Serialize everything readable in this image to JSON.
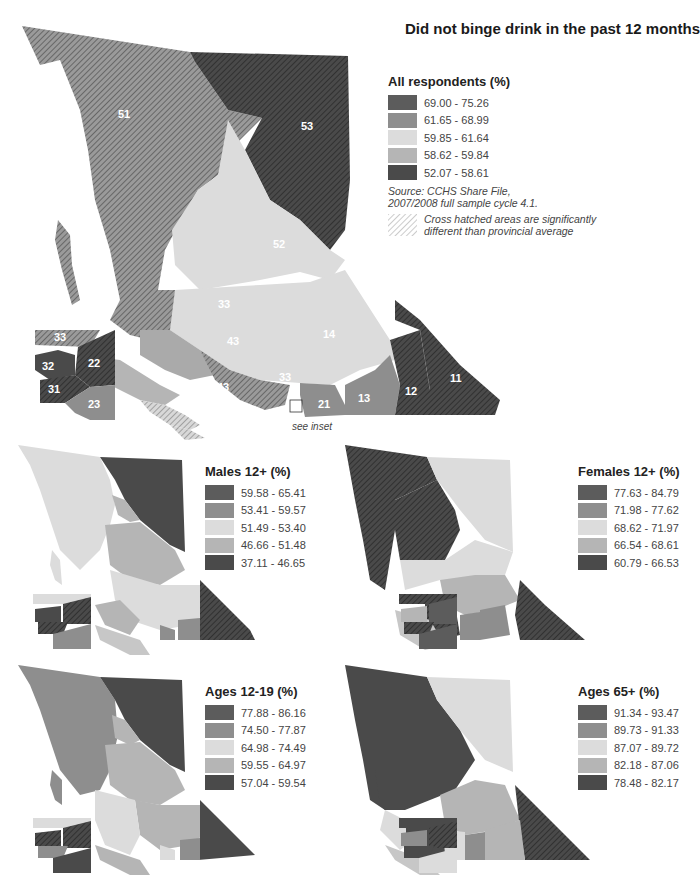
{
  "title": "Did not binge drink in the past 12 months",
  "colors": {
    "c1": "#5c5c5c",
    "c2": "#8e8e8e",
    "c3": "#dcdcdc",
    "c4": "#b5b5b5",
    "c5": "#4a4a4a"
  },
  "main_map": {
    "legend_title": "All respondents (%)",
    "classes": [
      "69.00 - 75.26",
      "61.65 - 68.99",
      "59.85 - 61.64",
      "58.62 - 59.84",
      "52.07 - 58.61"
    ],
    "source_line1": "Source: CCHS Share File,",
    "source_line2": "2007/2008 full sample cycle 4.1.",
    "hatch_note_line1": "Cross hatched areas are significantly",
    "hatch_note_line2": "different than provincial average",
    "region_labels": {
      "r51": "51",
      "r53": "53",
      "r52": "52",
      "r14": "14",
      "r33a": "33",
      "r43a": "43",
      "r43b": "43",
      "r33b": "33",
      "r42": "42",
      "r41": "41",
      "r21": "21",
      "r13": "13",
      "r12": "12",
      "r11": "11",
      "i33": "33",
      "i22": "22",
      "i32": "32",
      "i31": "31",
      "i23": "23"
    },
    "see_inset": "see inset"
  },
  "small_maps": [
    {
      "legend_title": "Males 12+ (%)",
      "classes": [
        "59.58 - 65.41",
        "53.41 - 59.57",
        "51.49 - 53.40",
        "46.66 - 51.48",
        "37.11 - 46.65"
      ]
    },
    {
      "legend_title": "Females 12+ (%)",
      "classes": [
        "77.63 - 84.79",
        "71.98 - 77.62",
        "68.62 - 71.97",
        "66.54 - 68.61",
        "60.79 - 66.53"
      ]
    },
    {
      "legend_title": "Ages 12-19 (%)",
      "classes": [
        "77.88 - 86.16",
        "74.50 - 77.87",
        "64.98 - 74.49",
        "59.55 - 64.97",
        "57.04 - 59.54"
      ]
    },
    {
      "legend_title": "Ages 65+ (%)",
      "classes": [
        "91.34 - 93.47",
        "89.73 - 91.33",
        "87.07 - 89.72",
        "82.18 - 87.06",
        "78.48 - 82.17"
      ]
    }
  ]
}
